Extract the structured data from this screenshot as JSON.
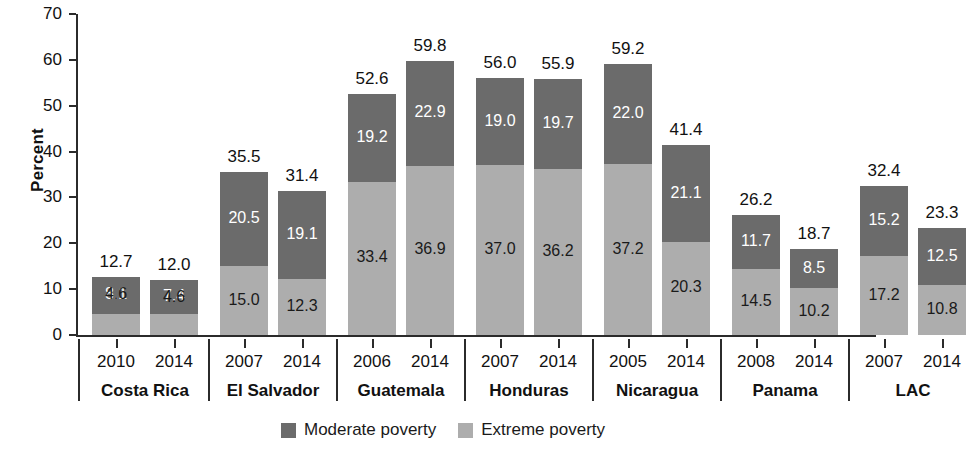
{
  "chart_data": {
    "type": "bar",
    "subtype": "stacked",
    "title": "",
    "xlabel": "",
    "ylabel": "Percent",
    "ylim": [
      0,
      70
    ],
    "yticks": [
      0,
      10,
      20,
      30,
      40,
      50,
      60,
      70
    ],
    "grid": false,
    "legend_position": "bottom",
    "colors": {
      "moderate": "#6b6b6b",
      "extreme": "#adadad",
      "axis": "#2b2b2b",
      "background": "#ffffff"
    },
    "series": [
      {
        "name": "Moderate poverty",
        "color": "#6b6b6b"
      },
      {
        "name": "Extreme poverty",
        "color": "#adadad"
      }
    ],
    "groups": [
      {
        "country": "Costa Rica",
        "bars": [
          {
            "year": "2010",
            "total": "12.7",
            "moderate": "8.1",
            "extreme": "4.6",
            "moderate_value": 8.1,
            "extreme_value": 4.6,
            "total_value": 12.7
          },
          {
            "year": "2014",
            "total": "12.0",
            "moderate": "7.4",
            "extreme": "4.6",
            "moderate_value": 7.4,
            "extreme_value": 4.6,
            "total_value": 12.0
          }
        ]
      },
      {
        "country": "El Salvador",
        "bars": [
          {
            "year": "2007",
            "total": "35.5",
            "moderate": "20.5",
            "extreme": "15.0",
            "moderate_value": 20.5,
            "extreme_value": 15.0,
            "total_value": 35.5
          },
          {
            "year": "2014",
            "total": "31.4",
            "moderate": "19.1",
            "extreme": "12.3",
            "moderate_value": 19.1,
            "extreme_value": 12.3,
            "total_value": 31.4
          }
        ]
      },
      {
        "country": "Guatemala",
        "bars": [
          {
            "year": "2006",
            "total": "52.6",
            "moderate": "19.2",
            "extreme": "33.4",
            "moderate_value": 19.2,
            "extreme_value": 33.4,
            "total_value": 52.6
          },
          {
            "year": "2014",
            "total": "59.8",
            "moderate": "22.9",
            "extreme": "36.9",
            "moderate_value": 22.9,
            "extreme_value": 36.9,
            "total_value": 59.8
          }
        ]
      },
      {
        "country": "Honduras",
        "bars": [
          {
            "year": "2007",
            "total": "56.0",
            "moderate": "19.0",
            "extreme": "37.0",
            "moderate_value": 19.0,
            "extreme_value": 37.0,
            "total_value": 56.0
          },
          {
            "year": "2014",
            "total": "55.9",
            "moderate": "19.7",
            "extreme": "36.2",
            "moderate_value": 19.7,
            "extreme_value": 36.2,
            "total_value": 55.9
          }
        ]
      },
      {
        "country": "Nicaragua",
        "bars": [
          {
            "year": "2005",
            "total": "59.2",
            "moderate": "22.0",
            "extreme": "37.2",
            "moderate_value": 22.0,
            "extreme_value": 37.2,
            "total_value": 59.2
          },
          {
            "year": "2014",
            "total": "41.4",
            "moderate": "21.1",
            "extreme": "20.3",
            "moderate_value": 21.1,
            "extreme_value": 20.3,
            "total_value": 41.4
          }
        ]
      },
      {
        "country": "Panama",
        "bars": [
          {
            "year": "2008",
            "total": "26.2",
            "moderate": "11.7",
            "extreme": "14.5",
            "moderate_value": 11.7,
            "extreme_value": 14.5,
            "total_value": 26.2
          },
          {
            "year": "2014",
            "total": "18.7",
            "moderate": "8.5",
            "extreme": "10.2",
            "moderate_value": 8.5,
            "extreme_value": 10.2,
            "total_value": 18.7
          }
        ]
      },
      {
        "country": "LAC",
        "bars": [
          {
            "year": "2007",
            "total": "32.4",
            "moderate": "15.2",
            "extreme": "17.2",
            "moderate_value": 15.2,
            "extreme_value": 17.2,
            "total_value": 32.4
          },
          {
            "year": "2014",
            "total": "23.3",
            "moderate": "12.5",
            "extreme": "10.8",
            "moderate_value": 12.5,
            "extreme_value": 10.8,
            "total_value": 23.3
          }
        ]
      }
    ]
  }
}
